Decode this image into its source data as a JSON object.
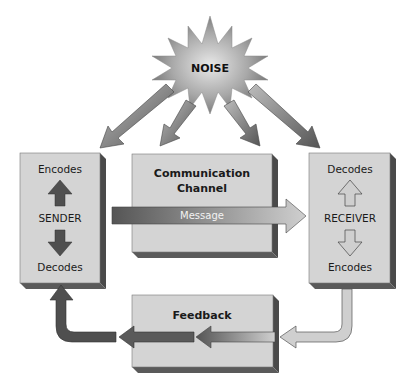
{
  "diagram": {
    "noise": {
      "label": "NOISE"
    },
    "sender": {
      "label": "SENDER",
      "top_label": "Encodes",
      "bottom_label": "Decodes"
    },
    "channel": {
      "label_line1": "Communication",
      "label_line2": "Channel",
      "message_label": "Message"
    },
    "receiver": {
      "label": "RECEIVER",
      "top_label": "Decodes",
      "bottom_label": "Encodes"
    },
    "feedback": {
      "label": "Feedback"
    },
    "colors": {
      "box_face": "#d4d4d4",
      "box_shadow": "#4a4a4a",
      "arrow_dark": "#4f4f4f",
      "arrow_light": "#c8c8c8",
      "background": "#ffffff"
    }
  }
}
